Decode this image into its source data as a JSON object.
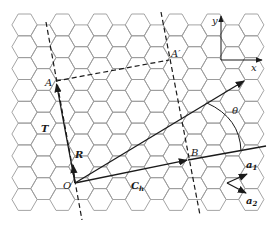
{
  "diagram": {
    "grid": {
      "side": 12.6,
      "origin_x": 24.5,
      "origin_y": 14,
      "cols": 13,
      "rows": 10,
      "stroke": "#9a9a9a"
    },
    "points": {
      "O": {
        "label": "O",
        "x": 75,
        "y": 183
      },
      "A": {
        "label": "A",
        "x": 56,
        "y": 81
      },
      "A_prime": {
        "label": "A′",
        "x": 169,
        "y": 60
      },
      "B": {
        "label": "B",
        "x": 188,
        "y": 160
      }
    },
    "vectors": {
      "T": {
        "label": "T"
      },
      "R": {
        "label": "R"
      },
      "Ch": {
        "label": "C",
        "subscript": "h"
      },
      "a1": {
        "label": "a",
        "subscript": "1"
      },
      "a2": {
        "label": "a",
        "subscript": "2"
      }
    },
    "angle": {
      "label": "θ"
    },
    "axes": {
      "x_label": "x",
      "y_label": "y"
    }
  }
}
